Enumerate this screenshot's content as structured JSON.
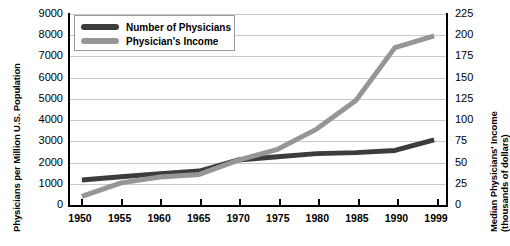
{
  "chart_data": {
    "type": "line",
    "title": "",
    "xlabel": "",
    "ylabel": "Physicians per Million U.S. Population",
    "y2label_line1": "Median Physicians' Income",
    "y2label_line2": "(thousands of dollars)",
    "categories": [
      "1950",
      "1955",
      "1960",
      "1965",
      "1970",
      "1975",
      "1980",
      "1985",
      "1990",
      "1999"
    ],
    "ylim": [
      0,
      9000
    ],
    "y2lim": [
      0,
      225
    ],
    "yticks": [
      "0",
      "1000",
      "2000",
      "3000",
      "4000",
      "5000",
      "6000",
      "7000",
      "8000",
      "9000"
    ],
    "y2ticks": [
      "0",
      "25",
      "50",
      "75",
      "100",
      "125",
      "150",
      "175",
      "200",
      "225"
    ],
    "grid": true,
    "legend_position": "top-left",
    "series": [
      {
        "name": "Number of Physicians",
        "axis": "left",
        "color": "#3c3c3c",
        "values": [
          1100,
          1250,
          1400,
          1520,
          2050,
          2200,
          2350,
          2400,
          2500,
          3000
        ]
      },
      {
        "name": "Physician's Income",
        "axis": "right",
        "color": "#969696",
        "values": [
          8,
          24,
          31,
          34,
          51,
          64,
          88,
          122,
          185,
          199
        ]
      }
    ]
  },
  "legend": {
    "items": [
      {
        "label": "Number of Physicians"
      },
      {
        "label": "Physician's Income"
      }
    ]
  },
  "colors": {
    "series_dark": "#3c3c3c",
    "series_gray": "#969696",
    "gridline": "#c9c9c9",
    "axis": "#000000"
  }
}
